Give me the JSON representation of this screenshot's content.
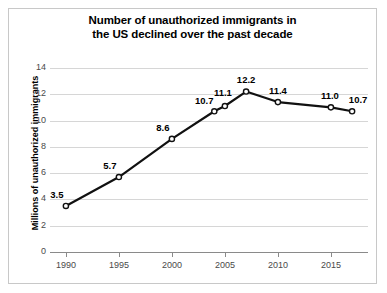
{
  "chart_data": {
    "type": "line",
    "title": "Number of unauthorized immigrants in the US declined over the past decade",
    "title_lines": [
      "Number of unauthorized immigrants in",
      "the US declined over the past decade"
    ],
    "xlabel": "",
    "ylabel": "Millions of unauthorized immigrants",
    "x": [
      1990,
      1995,
      2000,
      2004,
      2005,
      2007,
      2010,
      2015,
      2017
    ],
    "values": [
      3.5,
      5.7,
      8.6,
      10.7,
      11.1,
      12.2,
      11.4,
      11.0,
      10.7
    ],
    "point_labels": [
      "3.5",
      "5.7",
      "8.6",
      "10.7",
      "11.1",
      "12.2",
      "11.4",
      "11.0",
      "10.7"
    ],
    "xlim": [
      1988.5,
      2018.5
    ],
    "ylim": [
      0,
      14.6
    ],
    "xticks": [
      1990,
      1995,
      2000,
      2005,
      2010,
      2015
    ],
    "xtick_labels": [
      "1990",
      "1995",
      "2000",
      "2005",
      "2010",
      "2015"
    ],
    "yticks": [
      0,
      2,
      4,
      6,
      8,
      10,
      12,
      14
    ],
    "ytick_labels": [
      "0",
      "2",
      "4",
      "6",
      "8",
      "10",
      "12",
      "14"
    ],
    "grid": "horizontal",
    "legend": "none",
    "line_color": "#111111",
    "marker_fill": "#ffffff",
    "marker_edge": "#111111",
    "grid_color": "#d6d6d6",
    "axis_color": "#8a8a8a",
    "background": "#ffffff"
  }
}
